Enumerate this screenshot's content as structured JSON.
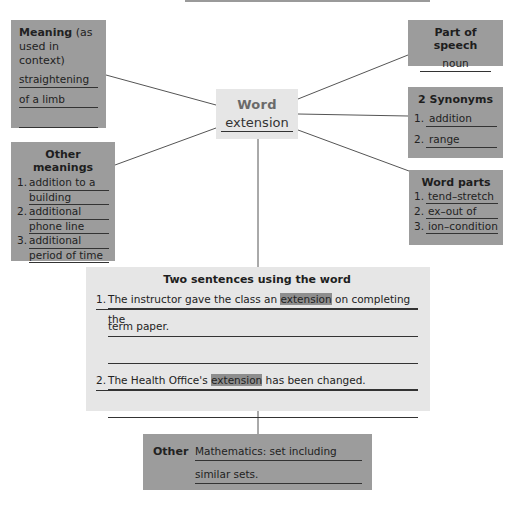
{
  "center": {
    "label": "Word",
    "word": "extension"
  },
  "meaning": {
    "title_bold": "Meaning",
    "title_rest": " (as used in context)",
    "lines": [
      "straightening",
      "of a limb",
      ""
    ]
  },
  "part_of_speech": {
    "title": "Part of speech",
    "value": "noun"
  },
  "synonyms": {
    "title": "2 Synonyms",
    "items": [
      {
        "num": "1.",
        "text": "addition"
      },
      {
        "num": "2.",
        "text": "range"
      }
    ]
  },
  "word_parts": {
    "title": "Word parts",
    "items": [
      {
        "num": "1.",
        "text": "tend–stretch"
      },
      {
        "num": "2.",
        "text": "ex–out of"
      },
      {
        "num": "3.",
        "text": "ion–condition"
      }
    ]
  },
  "other_meanings": {
    "title": "Other meanings",
    "items": [
      {
        "num": "1.",
        "line1": "addition to a",
        "line2": "building"
      },
      {
        "num": "2.",
        "line1": "additional",
        "line2": "phone line"
      },
      {
        "num": "3.",
        "line1": "additional",
        "line2": "period of time"
      }
    ]
  },
  "sentences": {
    "title": "Two sentences using the word",
    "s1": {
      "num": "1.",
      "pre": "The instructor gave the class an ",
      "hl": "extension",
      "post": " on completing the",
      "cont": "term paper."
    },
    "s2": {
      "num": "2.",
      "pre": "The Health Office's ",
      "hl": "extension",
      "post": " has been changed."
    }
  },
  "other": {
    "label": "Other",
    "lines": [
      "Mathematics: set including",
      "similar sets."
    ]
  },
  "colors": {
    "dark_box": "#9c9c9c",
    "light_box": "#e6e6e6",
    "highlight": "#8e8e8e",
    "line": "#555555"
  }
}
